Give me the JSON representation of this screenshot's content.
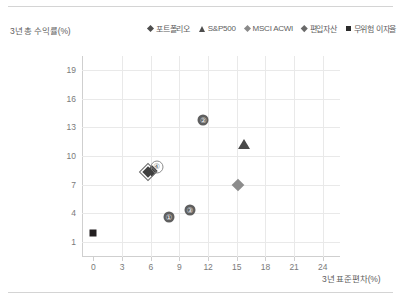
{
  "chart_data": {
    "type": "scatter",
    "title": "",
    "ylabel": "3년 총 수익률(%)",
    "xlabel": "3년 표준편차(%)",
    "xlim": [
      -1.2,
      25.8
    ],
    "ylim": [
      -0.6,
      20.5
    ],
    "xticks": [
      0,
      3,
      6,
      9,
      12,
      15,
      18,
      21,
      24
    ],
    "yticks": [
      1,
      4,
      7,
      10,
      13,
      16,
      19
    ],
    "grid": true,
    "legend_position": "top-right",
    "legend": [
      {
        "label": "포트폴리오",
        "marker": "diamond",
        "color": "#4d4d4d"
      },
      {
        "label": "S&P500",
        "marker": "triangle",
        "color": "#4d4d4d"
      },
      {
        "label": "MSCI ACWI",
        "marker": "diamond",
        "color": "#8a8a8a"
      },
      {
        "label": "편입자산",
        "marker": "diamond",
        "color": "#6a6a6a"
      },
      {
        "label": "무위험 이자율",
        "marker": "square",
        "color": "#2b2b2b"
      }
    ],
    "series": [
      {
        "name": "포트폴리오",
        "marker": "diamond-dark",
        "points": [
          {
            "label": "",
            "x": 6.1,
            "y": 8.4
          }
        ]
      },
      {
        "name": "S&P500",
        "marker": "triangle",
        "points": [
          {
            "label": "",
            "x": 15.8,
            "y": 11.3
          }
        ]
      },
      {
        "name": "MSCI ACWI",
        "marker": "diamond-gray",
        "points": [
          {
            "label": "",
            "x": 15.1,
            "y": 7.0
          }
        ]
      },
      {
        "name": "편입자산",
        "marker": "numbered",
        "points": [
          {
            "label": "①",
            "x": 7.9,
            "y": 3.6
          },
          {
            "label": "②",
            "x": 11.5,
            "y": 13.8
          },
          {
            "label": "③",
            "x": 10.1,
            "y": 4.3
          },
          {
            "label": "④",
            "x": 6.6,
            "y": 8.8
          }
        ]
      },
      {
        "name": "무위험 이자율",
        "marker": "square",
        "points": [
          {
            "label": "",
            "x": 0.0,
            "y": 1.9
          }
        ]
      }
    ]
  }
}
